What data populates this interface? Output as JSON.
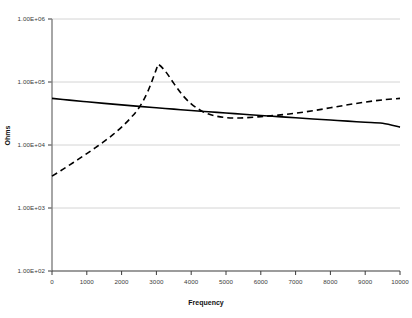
{
  "chart_data": {
    "type": "line",
    "title": "",
    "xlabel": "Frequency",
    "ylabel": "Ohms",
    "xlim": [
      0,
      10000
    ],
    "ylim": [
      100,
      1000000
    ],
    "yscale": "log",
    "xscale": "linear",
    "grid": true,
    "legend": "none",
    "xticks": [
      0,
      1000,
      2000,
      3000,
      4000,
      5000,
      6000,
      7000,
      8000,
      9000,
      10000
    ],
    "xticklabels": [
      "0",
      "1000",
      "2000",
      "3000",
      "4000",
      "5000",
      "6000",
      "7000",
      "8000",
      "9000",
      "10000"
    ],
    "yticks": [
      100,
      1000,
      10000,
      100000,
      1000000
    ],
    "yticklabels": [
      "1.00E+02",
      "1.00E+03",
      "1.00E+04",
      "1.00E+05",
      "1.00E+06"
    ],
    "series": [
      {
        "name": "solid-curve",
        "style": "solid",
        "color": "#000000",
        "width": 1.6,
        "x": [
          0,
          500,
          1000,
          1500,
          2000,
          2500,
          3000,
          3500,
          4000,
          4500,
          5000,
          5500,
          6000,
          6500,
          7000,
          7500,
          8000,
          8500,
          9000,
          9500,
          10000
        ],
        "y": [
          55000,
          51500,
          48500,
          45800,
          43300,
          41000,
          39000,
          37100,
          35300,
          33700,
          32200,
          30800,
          29400,
          28200,
          27000,
          25900,
          24900,
          23900,
          23000,
          22100,
          19200
        ]
      },
      {
        "name": "dashed-curve",
        "style": "dashed",
        "color": "#000000",
        "width": 1.6,
        "x": [
          0,
          250,
          500,
          750,
          1000,
          1250,
          1500,
          1750,
          2000,
          2250,
          2500,
          2750,
          3000,
          3050,
          3250,
          3500,
          3750,
          4000,
          4250,
          4500,
          4750,
          5000,
          5250,
          5500,
          6000,
          6500,
          7000,
          7500,
          8000,
          8500,
          9000,
          9500,
          10000
        ],
        "y": [
          3200,
          3900,
          4800,
          5900,
          7300,
          9100,
          11400,
          14600,
          19200,
          26500,
          39000,
          70000,
          160000,
          190000,
          150000,
          95000,
          62000,
          45000,
          36000,
          31000,
          28500,
          27200,
          26800,
          27000,
          28200,
          29800,
          32000,
          35000,
          39000,
          43500,
          48000,
          52000,
          55000
        ]
      }
    ],
    "annotations": {
      "peak_frequency": 3050,
      "peak_value": 190000,
      "minimum_frequency": 5250,
      "minimum_value": 26800
    }
  },
  "axis": {
    "x_title": "Frequency",
    "y_title": "Ohms"
  }
}
